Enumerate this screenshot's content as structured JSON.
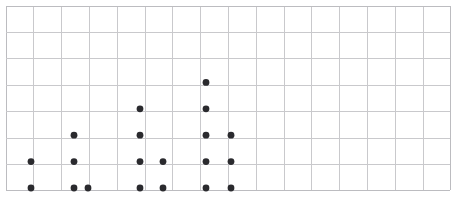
{
  "figure": {
    "name": "dotplot",
    "background_color": "#ffffff"
  },
  "grid": {
    "x0": 5.5,
    "y0": 5.5,
    "cols": 16,
    "rows": 7,
    "cell_width": 27.8,
    "cell_height": 26.4,
    "line_color": "#c9c9cc",
    "edge_color": "#bcbcc0",
    "show": true
  },
  "chart_data": {
    "type": "scatter",
    "title": "",
    "subtitle": "",
    "xlabel": "",
    "ylabel": "",
    "xlim": [
      0,
      16
    ],
    "ylim": [
      0,
      7
    ],
    "xticks": [],
    "yticks": [],
    "xticklabels": [],
    "yticklabels": [],
    "grid": true,
    "legend": null,
    "annotations": [],
    "marker": {
      "shape": "circle",
      "color": "#2a2a2e",
      "radius": 3.4
    },
    "categories": [
      1,
      2,
      3,
      4,
      5,
      6,
      7
    ],
    "stacks": [
      {
        "column_index": 1,
        "x": 31.0,
        "count": 2
      },
      {
        "column_index": 2,
        "x": 74.0,
        "count": 3
      },
      {
        "column_index": 3,
        "x": 88.0,
        "count": 1
      },
      {
        "column_index": 4,
        "x": 140.0,
        "count": 4
      },
      {
        "column_index": 5,
        "x": 163.0,
        "count": 2
      },
      {
        "column_index": 6,
        "x": 206.0,
        "count": 5
      },
      {
        "column_index": 7,
        "x": 231.0,
        "count": 3
      }
    ],
    "values": [
      2,
      3,
      1,
      4,
      2,
      5,
      3
    ],
    "x": [
      31.0,
      74.0,
      88.0,
      140.0,
      163.0,
      206.0,
      231.0
    ],
    "baseline_y": 188.0,
    "row_step": 26.4,
    "total_points": 20
  }
}
